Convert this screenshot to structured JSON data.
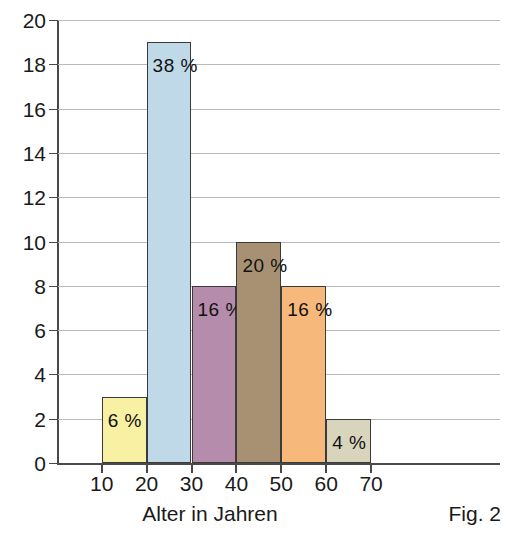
{
  "figure": {
    "caption": "Fig. 2",
    "clipped_header_text": "",
    "x_axis_title": "Alter in Jahren"
  },
  "chart_data": {
    "type": "bar",
    "title": "",
    "subtitle": "",
    "xlabel": "Alter in Jahren",
    "ylabel": "",
    "xlim": [
      0,
      80
    ],
    "ylim": [
      0,
      20
    ],
    "grid": true,
    "legend_position": "none",
    "x_tick_labels": [
      "10",
      "20",
      "30",
      "40",
      "50",
      "60",
      "70"
    ],
    "x_tick_values": [
      10,
      20,
      30,
      40,
      50,
      60,
      70
    ],
    "y_tick_labels": [
      "0",
      "2",
      "4",
      "6",
      "8",
      "10",
      "12",
      "14",
      "16",
      "18",
      "20"
    ],
    "y_tick_values": [
      0,
      2,
      4,
      6,
      8,
      10,
      12,
      14,
      16,
      18,
      20
    ],
    "categories": [
      "10-20",
      "20-30",
      "30-40",
      "40-50",
      "50-60",
      "60-70"
    ],
    "values": [
      3,
      19,
      8,
      10,
      8,
      2
    ],
    "bars": [
      {
        "bin_start": 10,
        "bin_end": 20,
        "value": 3,
        "annotation": "6 %",
        "color": "#F8F0A2"
      },
      {
        "bin_start": 20,
        "bin_end": 30,
        "value": 19,
        "annotation": "38 %",
        "color": "#BFD9E8"
      },
      {
        "bin_start": 30,
        "bin_end": 40,
        "value": 8,
        "annotation": "16 %",
        "color": "#B58CAC"
      },
      {
        "bin_start": 40,
        "bin_end": 50,
        "value": 10,
        "annotation": "20 %",
        "color": "#A89172"
      },
      {
        "bin_start": 50,
        "bin_end": 60,
        "value": 8,
        "annotation": "16 %",
        "color": "#F7B87B"
      },
      {
        "bin_start": 60,
        "bin_end": 70,
        "value": 2,
        "annotation": "4 %",
        "color": "#D9D5BD"
      }
    ],
    "annotations": [
      "6 %",
      "38 %",
      "16 %",
      "20 %",
      "16 %",
      "4 %"
    ],
    "colors": {
      "bar_outline": "#3A3A3A",
      "gridline": "#B9B9B9",
      "axis": "#4A4A4A",
      "background": "#FFFFFF",
      "text": "#1A1A1A"
    }
  }
}
